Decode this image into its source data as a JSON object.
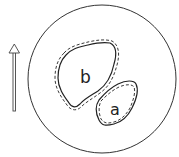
{
  "diagram": {
    "labels": {
      "region_b": "b",
      "region_a": "a"
    },
    "colors": {
      "stroke": "#333333",
      "arrow": "#444444",
      "background": "#ffffff"
    },
    "elements": {
      "outer_circle": "circle",
      "arrow": "upward-arrow",
      "region_b_outline": "solid with dashed outer boundary",
      "region_a_outline": "solid with dashed inner boundary"
    }
  }
}
